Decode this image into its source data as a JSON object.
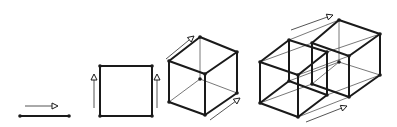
{
  "diagram": {
    "colors": {
      "edge": "#1a1a1a",
      "thin": "#555555",
      "background": "#ffffff"
    },
    "stages": [
      {
        "name": "segment",
        "vertices": [
          [
            20,
            116
          ],
          [
            69,
            116
          ]
        ],
        "edges": [
          [
            0,
            1
          ]
        ],
        "arrows": [
          {
            "from": [
              25,
              106
            ],
            "to": [
              58,
              106
            ]
          }
        ]
      },
      {
        "name": "square",
        "vertices": [
          [
            100,
            66
          ],
          [
            152,
            66
          ],
          [
            152,
            116
          ],
          [
            100,
            116
          ]
        ],
        "edges": [
          [
            0,
            1
          ],
          [
            1,
            2
          ],
          [
            2,
            3
          ],
          [
            3,
            0
          ]
        ],
        "arrows": [
          {
            "from": [
              94,
              108
            ],
            "to": [
              94,
              74
            ]
          },
          {
            "from": [
              157,
              108
            ],
            "to": [
              157,
              74
            ]
          }
        ]
      },
      {
        "name": "cube",
        "vertices": [
          [
            169,
            61
          ],
          [
            205,
            74
          ],
          [
            205,
            115
          ],
          [
            169,
            102
          ],
          [
            200,
            37
          ],
          [
            237,
            52
          ],
          [
            237,
            93
          ],
          [
            200,
            79
          ]
        ],
        "edges": [
          [
            0,
            1
          ],
          [
            1,
            2
          ],
          [
            2,
            3
          ],
          [
            3,
            0
          ],
          [
            4,
            5
          ],
          [
            5,
            6
          ],
          [
            0,
            4
          ],
          [
            1,
            5
          ],
          [
            2,
            6
          ]
        ],
        "hidden_edges": [
          [
            6,
            7
          ],
          [
            7,
            4
          ],
          [
            3,
            7
          ]
        ],
        "arrows": [
          {
            "from": [
              166,
              59
            ],
            "to": [
              194,
              36
            ]
          },
          {
            "from": [
              210,
              120
            ],
            "to": [
              240,
              98
            ]
          }
        ]
      },
      {
        "name": "tesseract",
        "vertices": [
          [
            260,
            62
          ],
          [
            298,
            75
          ],
          [
            298,
            117
          ],
          [
            260,
            103
          ],
          [
            289,
            40
          ],
          [
            327,
            52
          ],
          [
            327,
            95
          ],
          [
            289,
            81
          ],
          [
            312,
            43
          ],
          [
            349,
            56
          ],
          [
            349,
            97
          ],
          [
            312,
            84
          ],
          [
            339,
            20
          ],
          [
            380,
            34
          ],
          [
            380,
            75
          ],
          [
            339,
            62
          ]
        ],
        "edges": [
          [
            0,
            1
          ],
          [
            1,
            2
          ],
          [
            2,
            3
          ],
          [
            3,
            0
          ],
          [
            4,
            5
          ],
          [
            0,
            4
          ],
          [
            1,
            5
          ],
          [
            2,
            6
          ],
          [
            5,
            6
          ],
          [
            4,
            7
          ],
          [
            7,
            6
          ],
          [
            3,
            7
          ],
          [
            8,
            9
          ],
          [
            9,
            10
          ],
          [
            10,
            11
          ],
          [
            11,
            8
          ],
          [
            12,
            13
          ],
          [
            13,
            14
          ],
          [
            8,
            12
          ],
          [
            9,
            13
          ],
          [
            10,
            14
          ]
        ],
        "thin_edges": [
          [
            0,
            8
          ],
          [
            1,
            9
          ],
          [
            2,
            10
          ],
          [
            3,
            11
          ],
          [
            4,
            12
          ],
          [
            5,
            13
          ],
          [
            6,
            14
          ],
          [
            7,
            15
          ],
          [
            14,
            15
          ],
          [
            15,
            12
          ],
          [
            11,
            15
          ]
        ],
        "arrows": [
          {
            "from": [
              291,
              30
            ],
            "to": [
              333,
              15
            ]
          },
          {
            "from": [
              306,
              122
            ],
            "to": [
              347,
              106
            ]
          }
        ]
      }
    ]
  }
}
